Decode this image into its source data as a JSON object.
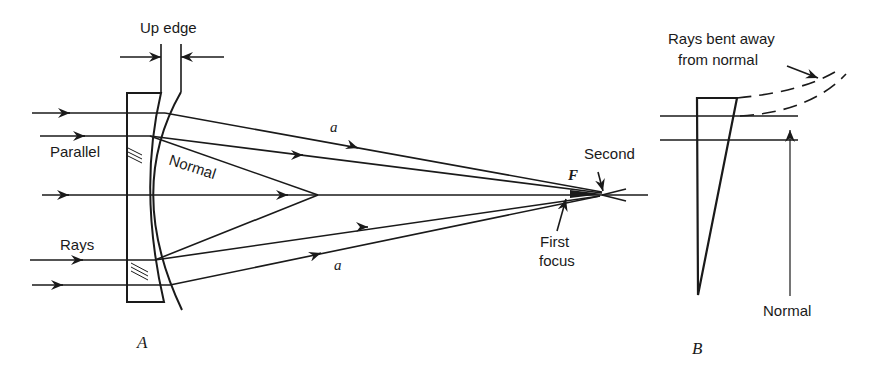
{
  "figure": {
    "panel_a": {
      "label": "A",
      "labels": {
        "up_edge": "Up edge",
        "parallel": "Parallel",
        "rays": "Rays",
        "normal": "Normal",
        "ray_a_top": "a",
        "ray_a_bottom": "a",
        "focus_f": "F",
        "second": "Second",
        "first_focus_line1": "First",
        "first_focus_line2": "focus"
      }
    },
    "panel_b": {
      "label": "B",
      "labels": {
        "rays_bent_line1": "Rays bent away",
        "rays_bent_line2": "from normal",
        "normal": "Normal"
      }
    },
    "colors": {
      "ink": "#1a1a1a",
      "background": "#ffffff"
    }
  }
}
